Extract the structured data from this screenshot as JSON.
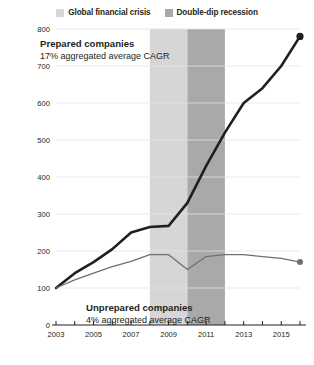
{
  "legend": {
    "entries": [
      {
        "label": "Global financial crisis",
        "color": "#d6d6d6",
        "swatch_name": "legend-swatch-financial-crisis"
      },
      {
        "label": "Double-dip recession",
        "color": "#a9a9a9",
        "swatch_name": "legend-swatch-double-dip"
      }
    ]
  },
  "annotations": {
    "prepared": {
      "title": "Prepared companies",
      "subtitle": "17% aggregated average CAGR"
    },
    "unprepared": {
      "title": "Unprepared companies",
      "subtitle": "4% aggregated average CAGR"
    }
  },
  "chart_data": {
    "type": "line",
    "title": "",
    "subtitle": "",
    "xlabel": "",
    "ylabel": "",
    "xlim": [
      2003,
      2016
    ],
    "ylim": [
      0,
      800
    ],
    "grid": true,
    "legend_position": "top-center",
    "y_ticks": [
      0,
      100,
      200,
      300,
      400,
      500,
      600,
      700,
      800
    ],
    "y_tick_labels": [
      "0",
      "100",
      "200",
      "300",
      "400",
      "500",
      "600",
      "700",
      "800"
    ],
    "x_ticks": [
      2003,
      2004,
      2005,
      2006,
      2007,
      2008,
      2009,
      2010,
      2011,
      2012,
      2013,
      2014,
      2015,
      2016
    ],
    "x_tick_labels_shown": [
      "2003",
      "2005",
      "2007",
      "2009",
      "2011",
      "2013",
      "2015"
    ],
    "x_labeled_values": [
      2003,
      2005,
      2007,
      2009,
      2011,
      2013,
      2015
    ],
    "x": [
      2003,
      2004,
      2005,
      2006,
      2007,
      2008,
      2009,
      2010,
      2011,
      2012,
      2013,
      2014,
      2015,
      2016
    ],
    "series": [
      {
        "name": "Prepared companies",
        "color": "#231f20",
        "line_width": 2.6,
        "end_marker": true,
        "values": [
          100,
          140,
          170,
          205,
          250,
          265,
          268,
          330,
          430,
          520,
          600,
          640,
          700,
          780
        ]
      },
      {
        "name": "Unprepared companies",
        "color": "#6f6f6f",
        "line_width": 1.3,
        "end_marker": true,
        "values": [
          100,
          122,
          140,
          158,
          172,
          190,
          190,
          150,
          185,
          190,
          190,
          185,
          180,
          170
        ]
      }
    ],
    "shaded_bands": [
      {
        "name": "Global financial crisis",
        "x_start": 2008,
        "x_end": 2010,
        "color": "#d6d6d6"
      },
      {
        "name": "Double-dip recession",
        "x_start": 2010,
        "x_end": 2012,
        "color": "#a9a9a9"
      }
    ]
  }
}
